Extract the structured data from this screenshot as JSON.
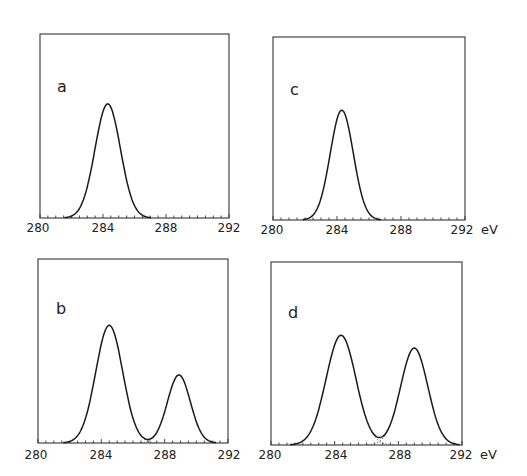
{
  "chart_data": [
    {
      "panel": "a",
      "type": "line",
      "title": "",
      "xlabel": "eV",
      "ylabel": "",
      "xlim": [
        280,
        292
      ],
      "xticks": [
        "280",
        "284",
        "288",
        "292"
      ],
      "grid": false,
      "peaks": [
        {
          "center": 284.3,
          "relative_height": 0.62,
          "fwhm": 1.9
        }
      ],
      "baseline_start": 281.4,
      "baseline_end": 287.4
    },
    {
      "panel": "c",
      "type": "line",
      "title": "",
      "xlabel": "eV",
      "ylabel": "",
      "xlim": [
        280,
        292
      ],
      "xticks": [
        "280",
        "284",
        "288",
        "292"
      ],
      "grid": false,
      "peaks": [
        {
          "center": 284.3,
          "relative_height": 0.6,
          "fwhm": 1.7
        }
      ],
      "baseline_start": 281.7,
      "baseline_end": 286.9
    },
    {
      "panel": "b",
      "type": "line",
      "title": "",
      "xlabel": "eV",
      "ylabel": "",
      "xlim": [
        280,
        292
      ],
      "xticks": [
        "280",
        "284",
        "288",
        "292"
      ],
      "grid": false,
      "peaks": [
        {
          "center": 284.5,
          "relative_height": 0.64,
          "fwhm": 2.0
        },
        {
          "center": 288.9,
          "relative_height": 0.37,
          "fwhm": 1.7
        }
      ],
      "valley": {
        "x": 287.1,
        "relative_height": 0.05
      },
      "component_fits": "dotted"
    },
    {
      "panel": "d",
      "type": "line",
      "title": "",
      "xlabel": "eV",
      "ylabel": "",
      "xlim": [
        280,
        292
      ],
      "xticks": [
        "280",
        "284",
        "288",
        "292"
      ],
      "grid": false,
      "peaks": [
        {
          "center": 284.4,
          "relative_height": 0.6,
          "fwhm": 2.2
        },
        {
          "center": 289.0,
          "relative_height": 0.53,
          "fwhm": 2.0
        }
      ],
      "valley": {
        "x": 286.9,
        "relative_height": 0.11
      },
      "component_fits": "dotted"
    }
  ],
  "panels": {
    "a": {
      "label": "a",
      "ticks": [
        "280",
        "284",
        "288",
        "292"
      ],
      "unit": ""
    },
    "b": {
      "label": "b",
      "ticks": [
        "280",
        "284",
        "288",
        "292"
      ],
      "unit": ""
    },
    "c": {
      "label": "c",
      "ticks": [
        "280",
        "284",
        "288",
        "292"
      ],
      "unit": "eV"
    },
    "d": {
      "label": "d",
      "ticks": [
        "280",
        "284",
        "288",
        "292"
      ],
      "unit": "eV"
    }
  }
}
